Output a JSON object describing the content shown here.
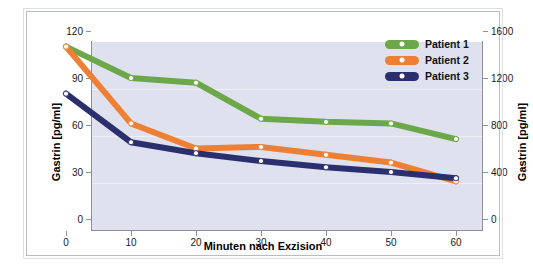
{
  "chart_data": {
    "type": "line",
    "title": "",
    "xlabel": "Minuten nach Exzision",
    "ylabel": "Gastrin [pg/ml]",
    "ylabel_right": "Gastrin [pg/ml]",
    "x": [
      0,
      10,
      20,
      30,
      40,
      50,
      60
    ],
    "xlim": [
      0,
      60
    ],
    "xticks": [
      "0",
      "10",
      "20",
      "30",
      "40",
      "50",
      "60"
    ],
    "ylim": [
      0,
      120
    ],
    "yticks": [
      "0",
      "30",
      "60",
      "90",
      "120"
    ],
    "ylim_right": [
      0,
      1600
    ],
    "yticks_right": [
      "0",
      "400",
      "800",
      "1200",
      "1600"
    ],
    "grid": true,
    "legend_position": "top-right",
    "series": [
      {
        "name": "Patient 1",
        "color": "#6ca84a",
        "values": [
          110,
          90,
          87,
          64,
          62,
          61,
          51
        ]
      },
      {
        "name": "Patient 2",
        "color": "#ef8033",
        "values": [
          110,
          61,
          45,
          46,
          41,
          36,
          24
        ]
      },
      {
        "name": "Patient 3",
        "color": "#2b2f6e",
        "values": [
          80,
          49,
          42,
          37,
          33,
          30,
          26
        ]
      }
    ]
  },
  "axes": {
    "left": {
      "title": "Gastrin [pg/ml]",
      "ticks": [
        "120",
        "90",
        "60",
        "30",
        "0"
      ]
    },
    "right": {
      "title": "Gastrin [pg/ml]",
      "ticks": [
        "1600",
        "1200",
        "800",
        "400",
        "0"
      ]
    },
    "bottom": {
      "title": "Minuten nach Exzision",
      "ticks": [
        "0",
        "10",
        "20",
        "30",
        "40",
        "50",
        "60"
      ]
    }
  },
  "legend": {
    "items": [
      {
        "label": "Patient 1",
        "color": "#6ca84a"
      },
      {
        "label": "Patient 2",
        "color": "#ef8033"
      },
      {
        "label": "Patient 3",
        "color": "#2b2f6e"
      }
    ]
  },
  "colors": {
    "plot_background": "#dfe2ee",
    "page_background": "#ffffff",
    "axis": "#8d9099",
    "gridline": "#eef0f7",
    "marker_fill": "#ffffff"
  }
}
